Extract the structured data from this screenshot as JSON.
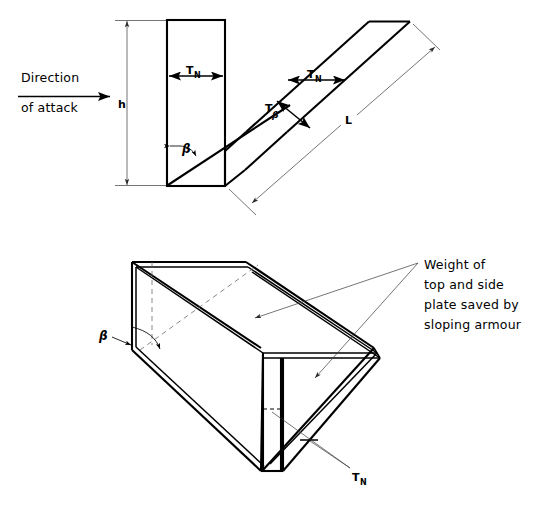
{
  "figure": {
    "background_color": "#ffffff",
    "line_color": "#000000",
    "width": 548,
    "height": 508
  },
  "top_view": {
    "name": "cross-section-view",
    "labels": {
      "direction_of_attack_line1": "Direction",
      "direction_of_attack_line2": "of attack",
      "height": "h",
      "normal_thickness": "T",
      "normal_thickness_sub": "N",
      "sloped_thickness": "T",
      "sloped_thickness_sub": "β",
      "angle": "β",
      "length": "L"
    }
  },
  "bottom_view": {
    "name": "isometric-view",
    "labels": {
      "angle": "β",
      "normal_thickness": "T",
      "normal_thickness_sub": "N",
      "callout_line1": "Weight of",
      "callout_line2": "top and side",
      "callout_line3": "plate saved by",
      "callout_line4": "sloping armour"
    }
  }
}
